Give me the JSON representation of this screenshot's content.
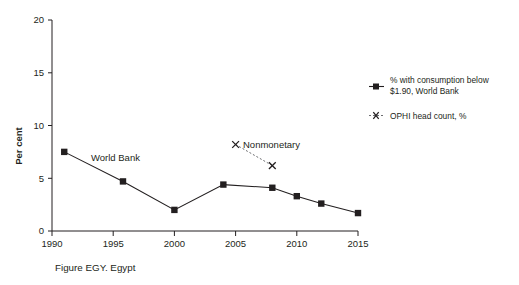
{
  "chart_data": {
    "type": "line",
    "title": "",
    "caption": "Figure EGY. Egypt",
    "xlabel": "",
    "ylabel": "Per cent",
    "xlim": [
      1990,
      2015
    ],
    "ylim": [
      0,
      20
    ],
    "xticks": [
      "1990",
      "1995",
      "2000",
      "2005",
      "2010",
      "2015"
    ],
    "yticks": [
      "0",
      "5",
      "10",
      "15",
      "20"
    ],
    "grid": false,
    "legend_position": "right",
    "series": [
      {
        "name": "% with consumption below $1.90, World Bank",
        "short_name": "World Bank",
        "marker": "square",
        "linestyle": "solid",
        "color": "#231f20",
        "x": [
          1991,
          1995.8,
          2000,
          2004,
          2008,
          2010,
          2012,
          2015
        ],
        "values": [
          7.5,
          4.7,
          2.0,
          4.4,
          4.1,
          3.3,
          2.6,
          1.7
        ]
      },
      {
        "name": "OPHI head count, %",
        "short_name": "Nonmonetary",
        "marker": "x",
        "linestyle": "dashed",
        "color": "#231f20",
        "x": [
          2005,
          2008
        ],
        "values": [
          8.2,
          6.2
        ]
      }
    ],
    "annotations": [
      {
        "text": "World Bank",
        "x": 1996.5,
        "y": 6.6
      },
      {
        "text": "Nonmonetary",
        "x": 2007.2,
        "y": 8.4
      }
    ]
  },
  "legend": {
    "entries": [
      {
        "label_line1": "% with consumption below",
        "label_line2": "$1.90, World Bank",
        "marker": "square-line"
      },
      {
        "label_line1": "OPHI head count, %",
        "label_line2": "",
        "marker": "x-dashed"
      }
    ]
  },
  "caption": {
    "text": "Figure EGY. Egypt"
  },
  "axes": {
    "y_title": "Per cent"
  }
}
